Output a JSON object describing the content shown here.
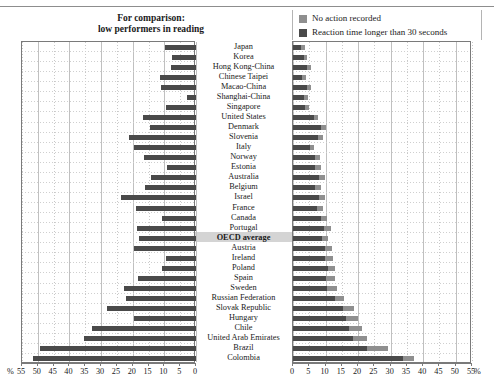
{
  "header": {
    "comparison_line1": "For comparison:",
    "comparison_line2": "low performers in reading"
  },
  "legend": {
    "items": [
      {
        "label": "No action recorded",
        "color": "#8f8f8f"
      },
      {
        "label": "Reaction time longer than 30 seconds",
        "color": "#4a4a4a"
      }
    ]
  },
  "axis": {
    "left_unit": "%",
    "right_unit": "%",
    "left_ticks": [
      "55",
      "50",
      "45",
      "40",
      "35",
      "30",
      "25",
      "20",
      "15",
      "10",
      "5",
      "0"
    ],
    "right_ticks": [
      "0",
      "5",
      "10",
      "15",
      "20",
      "25",
      "30",
      "35",
      "40",
      "45",
      "50",
      "55"
    ]
  },
  "chart_data": {
    "type": "bar",
    "title": "",
    "subtitle": "",
    "orientation": "horizontal-diverging",
    "xlabel": "%",
    "ylabel": "",
    "xlim_left": [
      0,
      55
    ],
    "xlim_right": [
      0,
      55
    ],
    "grid": true,
    "legend_position": "top-right",
    "left_panel_title": "For comparison: low performers in reading",
    "categories": [
      "Japan",
      "Korea",
      "Hong Kong-China",
      "Chinese Taipei",
      "Macao-China",
      "Shanghai-China",
      "Singapore",
      "United States",
      "Denmark",
      "Slovenia",
      "Italy",
      "Norway",
      "Estonia",
      "Australia",
      "Belgium",
      "Israel",
      "France",
      "Canada",
      "Portugal",
      "OECD average",
      "Austria",
      "Ireland",
      "Poland",
      "Spain",
      "Sweden",
      "Russian Federation",
      "Slovak Republic",
      "Hungary",
      "Chile",
      "United Arab Emirates",
      "Brazil",
      "Colombia"
    ],
    "highlight_category": "OECD average",
    "series": [
      {
        "name": "For comparison: low performers in reading",
        "panel": "left",
        "color": "#4a4a4a",
        "values": [
          9.8,
          7.6,
          8.0,
          11.4,
          11.2,
          2.9,
          9.6,
          16.6,
          14.6,
          21.1,
          19.5,
          16.3,
          9.1,
          14.2,
          16.1,
          23.6,
          18.9,
          10.7,
          18.8,
          18.0,
          19.5,
          9.6,
          10.6,
          18.3,
          22.7,
          22.2,
          28.2,
          19.7,
          33.0,
          35.5,
          49.2,
          51.4
        ]
      },
      {
        "name": "Reaction time longer than 30 seconds",
        "panel": "right",
        "color": "#4a4a4a",
        "values": [
          2.6,
          3.3,
          4.4,
          2.8,
          4.2,
          3.3,
          3.7,
          6.3,
          8.5,
          7.6,
          5.1,
          6.8,
          6.9,
          8.1,
          6.9,
          7.9,
          7.3,
          8.6,
          9.5,
          8.9,
          9.7,
          9.8,
          10.7,
          10.2,
          10.6,
          12.8,
          15.3,
          16.3,
          17.2,
          18.4,
          22.8,
          33.8
        ]
      },
      {
        "name": "No action recorded",
        "panel": "right",
        "color": "#8f8f8f",
        "values": [
          1.0,
          1.1,
          1.2,
          1.1,
          1.3,
          1.2,
          1.3,
          1.4,
          1.5,
          1.5,
          1.4,
          1.6,
          1.6,
          1.8,
          1.7,
          1.8,
          1.8,
          2.0,
          2.1,
          2.0,
          2.2,
          2.4,
          2.3,
          2.6,
          2.8,
          3.0,
          3.3,
          3.6,
          4.0,
          4.4,
          6.5,
          3.5
        ]
      }
    ]
  }
}
